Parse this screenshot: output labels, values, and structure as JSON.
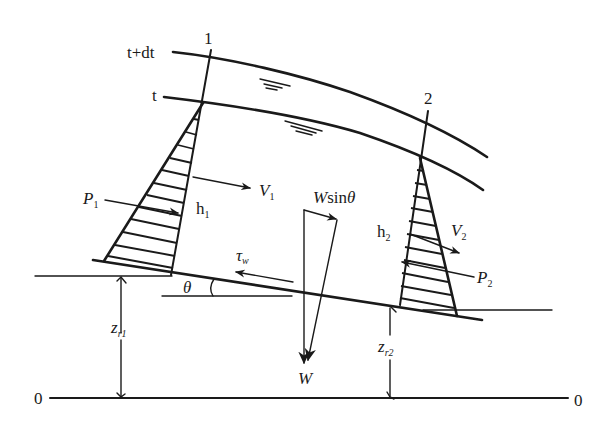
{
  "diagram": {
    "sections": [
      {
        "id": "1",
        "label": "1"
      },
      {
        "id": "2",
        "label": "2"
      }
    ],
    "surfaces": [
      {
        "id": "t+dt",
        "label": "t+dt"
      },
      {
        "id": "t",
        "label": "t"
      }
    ],
    "labels": {
      "P1": {
        "main": "P",
        "sub": "1"
      },
      "P2": {
        "main": "P",
        "sub": "2"
      },
      "V1": {
        "main": "V",
        "sub": "1"
      },
      "V2": {
        "main": "V",
        "sub": "2"
      },
      "h1": {
        "main": "h",
        "sub": "1"
      },
      "h2": {
        "main": "h",
        "sub": "2"
      },
      "Wsin": {
        "main": "W",
        "rest": "sin",
        "theta": "θ"
      },
      "W": {
        "main": "W"
      },
      "tau": {
        "main": "τ",
        "sub": "w"
      },
      "theta": "θ",
      "zr1": {
        "main": "z",
        "sub": "r1"
      },
      "zr2": {
        "main": "z",
        "sub": "r2"
      },
      "datum_left": "0",
      "datum_right": "0"
    },
    "colors": {
      "stroke": "#1a1a1a",
      "background": "#ffffff"
    }
  }
}
